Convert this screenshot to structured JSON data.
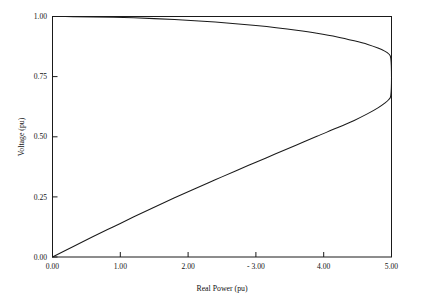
{
  "chart_data": {
    "type": "line",
    "title": "",
    "subtitle": "",
    "xlabel": "Real Power (pu)",
    "ylabel": "Voltage (pu)",
    "xlim": [
      0.0,
      5.0
    ],
    "ylim": [
      0.0,
      1.0
    ],
    "grid": false,
    "legend": null,
    "legend_position": "none",
    "xticks": [
      0.0,
      1.0,
      2.0,
      3.0,
      4.0,
      5.0
    ],
    "xtick_labels": [
      "0.00",
      "1.00",
      "2.00",
      "- 3.00",
      "4.00",
      "5.00"
    ],
    "yticks": [
      0.0,
      0.25,
      0.5,
      0.75,
      1.0
    ],
    "ytick_labels": [
      "0.00",
      "0.25",
      "0.50",
      "0.75",
      "1.00"
    ],
    "annotations": [],
    "series": [
      {
        "name": "PV nose curve",
        "color": "#1a1a1a",
        "x": [
          0.0,
          0.3,
          0.6,
          0.9,
          1.2,
          1.5,
          1.8,
          2.1,
          2.4,
          2.7,
          3.0,
          3.3,
          3.6,
          3.9,
          4.2,
          4.45,
          4.65,
          4.8,
          4.9,
          4.96,
          4.99,
          5.0,
          4.99,
          4.96,
          4.9,
          4.8,
          4.65,
          4.45,
          4.2,
          3.9,
          3.6,
          3.3,
          3.0,
          2.7,
          2.4,
          2.1,
          1.8,
          1.5,
          1.2,
          0.9,
          0.6,
          0.3,
          0.0
        ],
        "y": [
          1.0,
          0.9995,
          0.9985,
          0.9968,
          0.9944,
          0.9912,
          0.9872,
          0.9824,
          0.9767,
          0.97,
          0.9622,
          0.9532,
          0.9427,
          0.9303,
          0.9152,
          0.899,
          0.884,
          0.869,
          0.856,
          0.844,
          0.826,
          0.745,
          0.672,
          0.655,
          0.64,
          0.62,
          0.596,
          0.568,
          0.537,
          0.502,
          0.466,
          0.43,
          0.394,
          0.358,
          0.321,
          0.284,
          0.246,
          0.207,
          0.167,
          0.126,
          0.085,
          0.0425,
          0.0
        ]
      }
    ],
    "nose_point": {
      "x": 5.0,
      "y": 0.745
    }
  },
  "axes": {
    "x_title": "Real Power (pu)",
    "y_title": "Voltage (pu)"
  }
}
